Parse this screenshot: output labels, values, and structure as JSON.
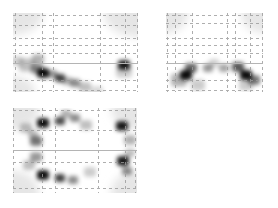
{
  "figure": {
    "width": 278,
    "height": 208,
    "background": "#ffffff",
    "grid_color": "#9a9a9a",
    "axis_line_color": "#b4b4b4",
    "blob_color": "#000000",
    "corner_tint_color": "#e6e6e6"
  },
  "chart_data": [
    {
      "type": "heatmap",
      "title": "",
      "xlabel": "",
      "ylabel": "",
      "grid": true,
      "legend": "none",
      "box": {
        "x": 13,
        "y": 13,
        "w": 125,
        "h": 79
      },
      "v_gridlines": [
        2,
        29,
        40,
        87,
        112,
        124
      ],
      "h_gridlines": [
        2,
        12,
        25,
        32,
        40,
        67,
        77
      ],
      "solid_hline": 50,
      "corner_tints": [
        {
          "cx": 0,
          "cy": 0,
          "rx": 30,
          "ry": 22
        },
        {
          "cx": 125,
          "cy": 0,
          "rx": 34,
          "ry": 24
        },
        {
          "cx": 0,
          "cy": 79,
          "rx": 22,
          "ry": 16
        }
      ],
      "blobs": [
        {
          "x": 4,
          "y": 48,
          "r": 6,
          "intensity": 0.18
        },
        {
          "x": 14,
          "y": 52,
          "r": 8,
          "intensity": 0.25
        },
        {
          "x": 25,
          "y": 46,
          "r": 6,
          "intensity": 0.3
        },
        {
          "x": 30,
          "y": 60,
          "r": 6,
          "intensity": 0.95
        },
        {
          "x": 24,
          "y": 56,
          "r": 6,
          "intensity": 0.45
        },
        {
          "x": 47,
          "y": 65,
          "r": 5,
          "intensity": 0.75
        },
        {
          "x": 39,
          "y": 61,
          "r": 5,
          "intensity": 0.4
        },
        {
          "x": 62,
          "y": 70,
          "r": 5,
          "intensity": 0.45
        },
        {
          "x": 54,
          "y": 68,
          "r": 5,
          "intensity": 0.3
        },
        {
          "x": 72,
          "y": 74,
          "r": 6,
          "intensity": 0.25
        },
        {
          "x": 84,
          "y": 78,
          "r": 6,
          "intensity": 0.15
        },
        {
          "x": 111,
          "y": 52,
          "r": 6,
          "intensity": 0.9
        },
        {
          "x": 111,
          "y": 58,
          "r": 8,
          "intensity": 0.2
        }
      ]
    },
    {
      "type": "heatmap",
      "title": "",
      "xlabel": "",
      "ylabel": "",
      "grid": true,
      "legend": "none",
      "box": {
        "x": 166,
        "y": 13,
        "w": 97,
        "h": 79
      },
      "v_gridlines": [
        1,
        9,
        26,
        61,
        69,
        84,
        96
      ],
      "h_gridlines": [
        2,
        10,
        25,
        32,
        40,
        67,
        77
      ],
      "solid_hline": 50,
      "corner_tints": [
        {
          "cx": 0,
          "cy": 0,
          "rx": 22,
          "ry": 20
        },
        {
          "cx": 97,
          "cy": 0,
          "rx": 22,
          "ry": 20
        }
      ],
      "blobs": [
        {
          "x": 13,
          "y": 67,
          "r": 8,
          "intensity": 0.3
        },
        {
          "x": 20,
          "y": 62,
          "r": 6,
          "intensity": 0.95
        },
        {
          "x": 25,
          "y": 55,
          "r": 6,
          "intensity": 0.6
        },
        {
          "x": 32,
          "y": 72,
          "r": 7,
          "intensity": 0.2
        },
        {
          "x": 42,
          "y": 55,
          "r": 5,
          "intensity": 0.4
        },
        {
          "x": 48,
          "y": 50,
          "r": 5,
          "intensity": 0.18
        },
        {
          "x": 58,
          "y": 55,
          "r": 5,
          "intensity": 0.35
        },
        {
          "x": 72,
          "y": 54,
          "r": 6,
          "intensity": 0.65
        },
        {
          "x": 80,
          "y": 62,
          "r": 6,
          "intensity": 0.95
        },
        {
          "x": 88,
          "y": 67,
          "r": 6,
          "intensity": 0.55
        },
        {
          "x": 80,
          "y": 72,
          "r": 7,
          "intensity": 0.2
        }
      ]
    },
    {
      "type": "heatmap",
      "title": "",
      "xlabel": "",
      "ylabel": "",
      "grid": true,
      "legend": "none",
      "box": {
        "x": 13,
        "y": 108,
        "w": 124,
        "h": 85
      },
      "v_gridlines": [
        0,
        29,
        42,
        85,
        112,
        122
      ],
      "h_gridlines": [
        2,
        22,
        54,
        80
      ],
      "solid_hline": 42,
      "corner_tints": [
        {
          "cx": 0,
          "cy": 0,
          "rx": 26,
          "ry": 22
        },
        {
          "cx": 124,
          "cy": 0,
          "rx": 26,
          "ry": 22
        },
        {
          "cx": 0,
          "cy": 85,
          "rx": 26,
          "ry": 22
        },
        {
          "cx": 124,
          "cy": 85,
          "rx": 26,
          "ry": 22
        }
      ],
      "blobs": [
        {
          "x": 13,
          "y": 20,
          "r": 6,
          "intensity": 0.25
        },
        {
          "x": 30,
          "y": 15,
          "r": 6,
          "intensity": 0.95
        },
        {
          "x": 47,
          "y": 13,
          "r": 5,
          "intensity": 0.7
        },
        {
          "x": 53,
          "y": 6,
          "r": 5,
          "intensity": 0.3
        },
        {
          "x": 62,
          "y": 10,
          "r": 5,
          "intensity": 0.45
        },
        {
          "x": 73,
          "y": 17,
          "r": 6,
          "intensity": 0.25
        },
        {
          "x": 23,
          "y": 33,
          "r": 6,
          "intensity": 0.55
        },
        {
          "x": 20,
          "y": 26,
          "r": 5,
          "intensity": 0.25
        },
        {
          "x": 23,
          "y": 49,
          "r": 6,
          "intensity": 0.4
        },
        {
          "x": 16,
          "y": 57,
          "r": 6,
          "intensity": 0.25
        },
        {
          "x": 30,
          "y": 67,
          "r": 6,
          "intensity": 0.95
        },
        {
          "x": 47,
          "y": 70,
          "r": 5,
          "intensity": 0.75
        },
        {
          "x": 60,
          "y": 72,
          "r": 5,
          "intensity": 0.45
        },
        {
          "x": 77,
          "y": 64,
          "r": 6,
          "intensity": 0.2
        },
        {
          "x": 109,
          "y": 18,
          "r": 6,
          "intensity": 0.9
        },
        {
          "x": 117,
          "y": 32,
          "r": 6,
          "intensity": 0.3
        },
        {
          "x": 117,
          "y": 45,
          "r": 5,
          "intensity": 0.25
        },
        {
          "x": 110,
          "y": 53,
          "r": 6,
          "intensity": 0.9
        },
        {
          "x": 114,
          "y": 63,
          "r": 5,
          "intensity": 0.45
        }
      ]
    }
  ]
}
